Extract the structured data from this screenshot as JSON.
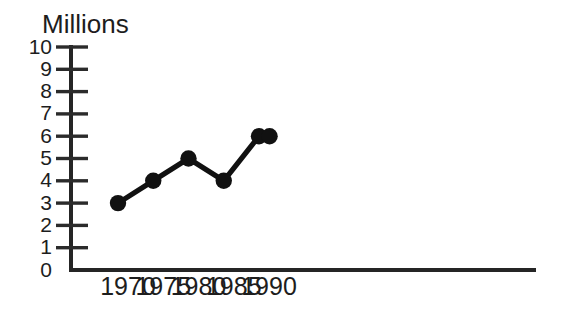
{
  "chart_data": {
    "type": "line",
    "title": "",
    "ylabel": "Millions",
    "xlabel": "",
    "x": [
      1970,
      1975,
      1980,
      1985,
      1990,
      1991.5
    ],
    "values": [
      3,
      4,
      5,
      4,
      6,
      6
    ],
    "series": [
      {
        "name": "Millions",
        "values": [
          3,
          4,
          5,
          4,
          6,
          6
        ]
      }
    ],
    "ylim": [
      0,
      10
    ],
    "xlim": [
      1967.5,
      1992.8
    ],
    "y_ticks": [
      0,
      1,
      2,
      3,
      4,
      5,
      6,
      7,
      8,
      9,
      10
    ],
    "y_tick_labels": [
      "0",
      "1",
      "2",
      "3",
      "4",
      "5",
      "6",
      "7",
      "8",
      "9",
      "10"
    ],
    "x_ticks": [
      1970,
      1975,
      1980,
      1985,
      1990
    ],
    "x_tick_labels": [
      "1970",
      "1975",
      "1980",
      "1985",
      "1990"
    ],
    "grid": false,
    "legend_position": "none",
    "marker": "filled-circle",
    "line_color": "#111111",
    "marker_color": "#111111",
    "axis_color": "#252525",
    "background_color": "#ffffff"
  },
  "axis_title": {
    "text": "Millions"
  },
  "y_axis": {
    "labels": [
      "10",
      "9",
      "8",
      "7",
      "6",
      "5",
      "4",
      "3",
      "2",
      "1",
      "0"
    ]
  },
  "x_axis": {
    "labels": [
      "1970",
      "1975",
      "1980",
      "1985",
      "1990"
    ]
  }
}
